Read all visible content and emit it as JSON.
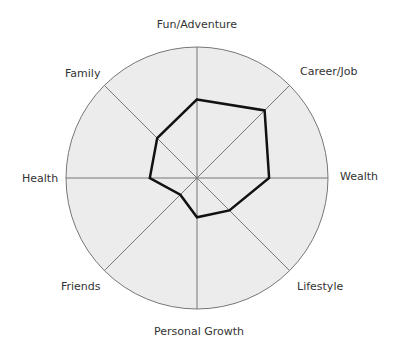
{
  "chart_data": {
    "type": "radar",
    "title": "",
    "categories": [
      "Fun/Adventure",
      "Career/Job",
      "Wealth",
      "Lifestyle",
      "Personal Growth",
      "Friends",
      "Health",
      "Family"
    ],
    "values": [
      6,
      7.3,
      5.5,
      3.5,
      3,
      1.8,
      3.6,
      4.3
    ],
    "scale_max": 10,
    "grid": true,
    "colors": {
      "fill": "#ececec",
      "line": "#777777",
      "series": "#111111"
    }
  },
  "labels": {
    "fun": "Fun/Adventure",
    "career": "Career/Job",
    "wealth": "Wealth",
    "lifestyle": "Lifestyle",
    "growth": "Personal Growth",
    "friends": "Friends",
    "health": "Health",
    "family": "Family"
  }
}
